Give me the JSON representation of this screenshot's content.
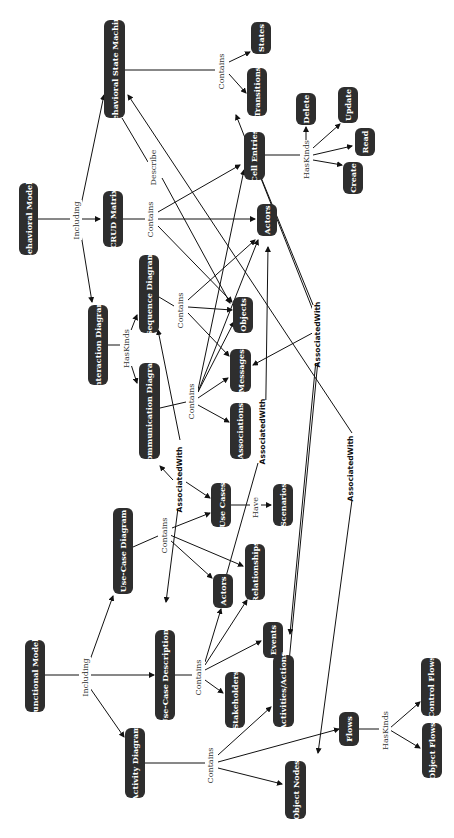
{
  "diagram": {
    "orientation": "rotated-90-ccw",
    "colors": {
      "node_fill": "#2e2e2e",
      "node_text": "#ffffff",
      "edge": "#111111",
      "label": "#333333"
    },
    "nodes": [
      {
        "id": "behavioral_models",
        "label": "Behavioral Models"
      },
      {
        "id": "functional_models",
        "label": "Functional Models"
      },
      {
        "id": "bsm",
        "label": "Behavioral State Machine"
      },
      {
        "id": "crud",
        "label": "CRUD Matrix"
      },
      {
        "id": "interaction",
        "label": "Interaction Diagram"
      },
      {
        "id": "sequence",
        "label": "Sequence Diagram"
      },
      {
        "id": "communication",
        "label": "Communication Diagram"
      },
      {
        "id": "usecase_diagram",
        "label": "Use-Case Diagram"
      },
      {
        "id": "usecase_desc",
        "label": "Use-Case Descriptions"
      },
      {
        "id": "activity",
        "label": "Activity Diagram"
      },
      {
        "id": "states",
        "label": "States"
      },
      {
        "id": "transitions",
        "label": "Transitions"
      },
      {
        "id": "cell_entries",
        "label": "Cell Entries"
      },
      {
        "id": "delete",
        "label": "Delete"
      },
      {
        "id": "update",
        "label": "Update"
      },
      {
        "id": "read",
        "label": "Read"
      },
      {
        "id": "create",
        "label": "Create"
      },
      {
        "id": "actors_top",
        "label": "Actors"
      },
      {
        "id": "objects",
        "label": "Objects"
      },
      {
        "id": "messages",
        "label": "Messages"
      },
      {
        "id": "associations",
        "label": "Associations"
      },
      {
        "id": "use_cases",
        "label": "Use Cases"
      },
      {
        "id": "scenarios",
        "label": "Scenarios"
      },
      {
        "id": "actors_mid",
        "label": "Actors"
      },
      {
        "id": "relationships",
        "label": "Relationships"
      },
      {
        "id": "events",
        "label": "Events"
      },
      {
        "id": "stakeholders",
        "label": "Stakeholders"
      },
      {
        "id": "activities_actions",
        "label": "Activities/Actions"
      },
      {
        "id": "object_nodes",
        "label": "Object Nodes"
      },
      {
        "id": "flows",
        "label": "Flows"
      },
      {
        "id": "control_flows",
        "label": "Control Flows"
      },
      {
        "id": "object_flows",
        "label": "Object Flows"
      }
    ],
    "edge_labels": {
      "including_beh": "Including",
      "including_fun": "Including",
      "contains_bsm": "Contains",
      "describe": "Describe",
      "contains_crud": "Contains",
      "haskinds_crud": "HasKinds",
      "haskinds_inter": "HasKinds",
      "contains_seq": "Contains",
      "contains_comm": "Contains",
      "contains_ucd": "Contains",
      "have": "Have",
      "contains_ucdesc": "Contains",
      "contains_act": "Contains",
      "haskinds_flows": "HasKinds",
      "assoc_1": "AssociatedWith",
      "assoc_2": "AssociatedWith",
      "assoc_3": "AssociatedWith",
      "assoc_4": "AssociatedWith"
    },
    "edges": [
      {
        "from": "behavioral_models",
        "to": "bsm",
        "label": "Including"
      },
      {
        "from": "behavioral_models",
        "to": "crud",
        "label": "Including"
      },
      {
        "from": "behavioral_models",
        "to": "interaction",
        "label": "Including"
      },
      {
        "from": "bsm",
        "to": "states",
        "label": "Contains"
      },
      {
        "from": "bsm",
        "to": "transitions",
        "label": "Contains"
      },
      {
        "from": "bsm",
        "to": "objects",
        "label": "Describe"
      },
      {
        "from": "crud",
        "to": "cell_entries",
        "label": "Contains"
      },
      {
        "from": "crud",
        "to": "actors_top",
        "label": "Contains"
      },
      {
        "from": "crud",
        "to": "objects",
        "label": "Contains"
      },
      {
        "from": "cell_entries",
        "to": "delete",
        "label": "HasKinds"
      },
      {
        "from": "cell_entries",
        "to": "update",
        "label": "HasKinds"
      },
      {
        "from": "cell_entries",
        "to": "read",
        "label": "HasKinds"
      },
      {
        "from": "cell_entries",
        "to": "create",
        "label": "HasKinds"
      },
      {
        "from": "interaction",
        "to": "sequence",
        "label": "HasKinds"
      },
      {
        "from": "interaction",
        "to": "communication",
        "label": "HasKinds"
      },
      {
        "from": "sequence",
        "to": "objects",
        "label": "Contains"
      },
      {
        "from": "sequence",
        "to": "messages",
        "label": "Contains"
      },
      {
        "from": "sequence",
        "to": "actors_top",
        "label": "Contains"
      },
      {
        "from": "communication",
        "to": "objects",
        "label": "Contains"
      },
      {
        "from": "communication",
        "to": "messages",
        "label": "Contains"
      },
      {
        "from": "communication",
        "to": "associations",
        "label": "Contains"
      },
      {
        "from": "communication",
        "to": "actors_top",
        "label": "Contains"
      },
      {
        "from": "communication",
        "to": "cell_entries",
        "label": "Contains"
      },
      {
        "from": "functional_models",
        "to": "usecase_diagram",
        "label": "Including"
      },
      {
        "from": "functional_models",
        "to": "usecase_desc",
        "label": "Including"
      },
      {
        "from": "functional_models",
        "to": "activity",
        "label": "Including"
      },
      {
        "from": "usecase_diagram",
        "to": "use_cases",
        "label": "Contains"
      },
      {
        "from": "usecase_diagram",
        "to": "actors_mid",
        "label": "Contains"
      },
      {
        "from": "usecase_diagram",
        "to": "relationships",
        "label": "Contains"
      },
      {
        "from": "use_cases",
        "to": "scenarios",
        "label": "Have"
      },
      {
        "from": "usecase_desc",
        "to": "actors_mid",
        "label": "Contains"
      },
      {
        "from": "usecase_desc",
        "to": "relationships",
        "label": "Contains"
      },
      {
        "from": "usecase_desc",
        "to": "events",
        "label": "Contains"
      },
      {
        "from": "usecase_desc",
        "to": "stakeholders",
        "label": "Contains"
      },
      {
        "from": "activity",
        "to": "activities_actions",
        "label": "Contains"
      },
      {
        "from": "activity",
        "to": "object_nodes",
        "label": "Contains"
      },
      {
        "from": "activity",
        "to": "flows",
        "label": "Contains"
      },
      {
        "from": "flows",
        "to": "control_flows",
        "label": "HasKinds"
      },
      {
        "from": "flows",
        "to": "object_flows",
        "label": "HasKinds"
      },
      {
        "from": "use_cases",
        "to": "sequence",
        "label": "AssociatedWith"
      },
      {
        "from": "use_cases",
        "to": "communication",
        "label": "AssociatedWith"
      },
      {
        "from": "use_cases",
        "to": "usecase_desc",
        "label": "AssociatedWith"
      },
      {
        "from": "associations",
        "to": "actors_mid",
        "label": "AssociatedWith"
      },
      {
        "from": "messages",
        "to": "actors_top",
        "label": "AssociatedWith"
      },
      {
        "from": "object_nodes",
        "to": "bsm",
        "label": "AssociatedWith"
      }
    ]
  }
}
